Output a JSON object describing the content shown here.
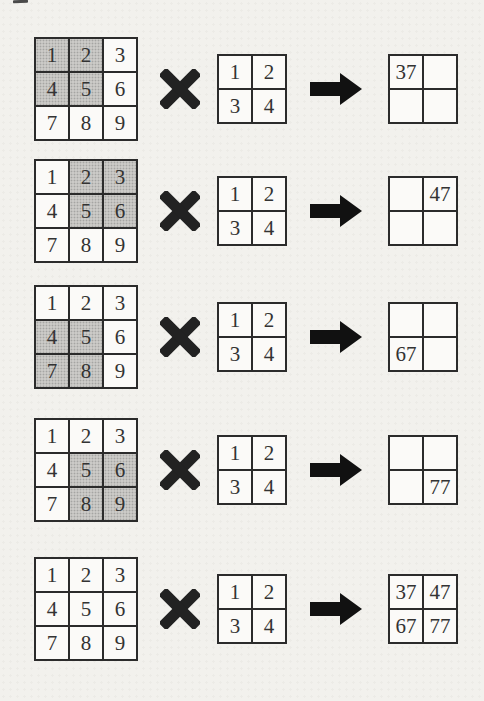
{
  "diagram_title": "convolution-steps",
  "input_matrix": {
    "rows": [
      [
        "1",
        "2",
        "3"
      ],
      [
        "4",
        "5",
        "6"
      ],
      [
        "7",
        "8",
        "9"
      ]
    ]
  },
  "kernel": {
    "rows": [
      [
        "1",
        "2"
      ],
      [
        "3",
        "4"
      ]
    ]
  },
  "steps": [
    {
      "name": "top-left",
      "shaded_cells": [
        [
          0,
          0
        ],
        [
          0,
          1
        ],
        [
          1,
          0
        ],
        [
          1,
          1
        ]
      ],
      "output": [
        [
          "37",
          ""
        ],
        [
          "",
          ""
        ]
      ]
    },
    {
      "name": "top-right",
      "shaded_cells": [
        [
          0,
          1
        ],
        [
          0,
          2
        ],
        [
          1,
          1
        ],
        [
          1,
          2
        ]
      ],
      "output": [
        [
          "",
          "47"
        ],
        [
          "",
          ""
        ]
      ]
    },
    {
      "name": "bottom-left",
      "shaded_cells": [
        [
          1,
          0
        ],
        [
          1,
          1
        ],
        [
          2,
          0
        ],
        [
          2,
          1
        ]
      ],
      "output": [
        [
          "",
          ""
        ],
        [
          "67",
          ""
        ]
      ]
    },
    {
      "name": "bottom-right",
      "shaded_cells": [
        [
          1,
          1
        ],
        [
          1,
          2
        ],
        [
          2,
          1
        ],
        [
          2,
          2
        ]
      ],
      "output": [
        [
          "",
          ""
        ],
        [
          "",
          "77"
        ]
      ]
    },
    {
      "name": "final",
      "shaded_cells": [],
      "output": [
        [
          "37",
          "47"
        ],
        [
          "67",
          "77"
        ]
      ]
    }
  ],
  "icons": {
    "multiply": "multiply-icon",
    "arrow": "arrow-right-icon"
  },
  "colors": {
    "background": "#f2f1ed",
    "border": "#2b2b2b",
    "shaded_cell": "#cbcac7",
    "number_ink": "#333333",
    "operator": "#222222"
  }
}
